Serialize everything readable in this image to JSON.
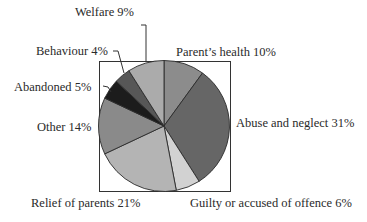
{
  "chart_data": {
    "type": "pie",
    "title": "",
    "start_angle_deg": 0,
    "direction": "clockwise",
    "slices": [
      {
        "label": "Parent's health",
        "value": 10,
        "color": "#8c8c8c"
      },
      {
        "label": "Abuse and neglect",
        "value": 31,
        "color": "#666666"
      },
      {
        "label": "Guilty or accused of offence",
        "value": 6,
        "color": "#d2d2d2"
      },
      {
        "label": "Relief of parents",
        "value": 21,
        "color": "#b4b4b4"
      },
      {
        "label": "Other",
        "value": 14,
        "color": "#8a8a8a"
      },
      {
        "label": "Abandoned",
        "value": 5,
        "color": "#1c1c1c"
      },
      {
        "label": "Behaviour",
        "value": 4,
        "color": "#575757"
      },
      {
        "label": "Welfare",
        "value": 9,
        "color": "#ababab"
      }
    ],
    "unit": "%",
    "frame": true
  },
  "labels": {
    "welfare": "Welfare 9%",
    "behaviour": "Behaviour 4%",
    "abandoned": "Abandoned 5%",
    "parents_health": "Parent’s health 10%",
    "other": "Other 14%",
    "abuse": "Abuse and neglect 31%",
    "relief": "Relief of parents 21%",
    "guilty": "Guilty or accused of offence 6%"
  }
}
